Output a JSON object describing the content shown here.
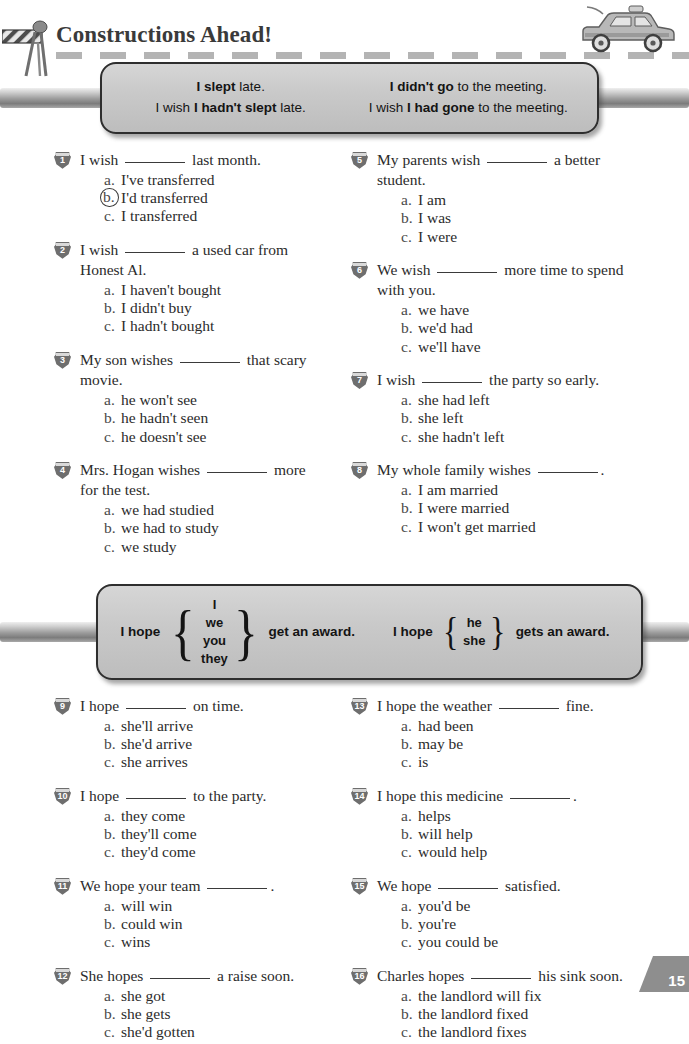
{
  "header": {
    "title": "Constructions Ahead!",
    "barricade_icon": "road-barricade-icon",
    "car_icon": "car-icon",
    "road_line": "dashed-road-marking"
  },
  "page_number": "15",
  "banner_wish": {
    "left": {
      "line1_pre": "",
      "line1_bold": "I slept",
      "line1_post": " late.",
      "line2_pre": "I wish ",
      "line2_bold": "I hadn't slept",
      "line2_post": " late."
    },
    "right": {
      "line1_pre": "",
      "line1_bold": "I didn't go",
      "line1_post": " to the meeting.",
      "line2_pre": "I wish ",
      "line2_bold": "I had gone",
      "line2_post": " to the meeting."
    }
  },
  "banner_hope": {
    "left": {
      "lead": "I hope",
      "subjects": [
        "I",
        "we",
        "you",
        "they"
      ],
      "tail": "get an award."
    },
    "right": {
      "lead": "I hope",
      "subjects": [
        "he",
        "she"
      ],
      "tail": "gets an award."
    }
  },
  "exercises_top": {
    "left": [
      {
        "num": "1",
        "stem_pre": "I wish",
        "stem_post": "last month.",
        "stem_line2": "",
        "choices": [
          {
            "letter": "a.",
            "text": "I've transferred",
            "circled": false
          },
          {
            "letter": "b.",
            "text": "I'd transferred",
            "circled": true
          },
          {
            "letter": "c.",
            "text": "I transferred",
            "circled": false
          }
        ]
      },
      {
        "num": "2",
        "stem_pre": "I wish",
        "stem_post": "a used car from",
        "stem_line2": "Honest Al.",
        "choices": [
          {
            "letter": "a.",
            "text": "I haven't bought",
            "circled": false
          },
          {
            "letter": "b.",
            "text": "I didn't buy",
            "circled": false
          },
          {
            "letter": "c.",
            "text": "I hadn't bought",
            "circled": false
          }
        ]
      },
      {
        "num": "3",
        "stem_pre": "My son wishes",
        "stem_post": "that scary",
        "stem_line2": "movie.",
        "choices": [
          {
            "letter": "a.",
            "text": "he won't see",
            "circled": false
          },
          {
            "letter": "b.",
            "text": "he hadn't seen",
            "circled": false
          },
          {
            "letter": "c.",
            "text": "he doesn't see",
            "circled": false
          }
        ]
      },
      {
        "num": "4",
        "stem_pre": "Mrs. Hogan wishes",
        "stem_post": "more",
        "stem_line2": "for the test.",
        "choices": [
          {
            "letter": "a.",
            "text": "we had studied",
            "circled": false
          },
          {
            "letter": "b.",
            "text": "we had to study",
            "circled": false
          },
          {
            "letter": "c.",
            "text": "we study",
            "circled": false
          }
        ]
      }
    ],
    "right": [
      {
        "num": "5",
        "stem_pre": "My parents wish",
        "stem_post": "a better",
        "stem_line2": "student.",
        "choices": [
          {
            "letter": "a.",
            "text": "I am",
            "circled": false
          },
          {
            "letter": "b.",
            "text": "I was",
            "circled": false
          },
          {
            "letter": "c.",
            "text": "I were",
            "circled": false
          }
        ]
      },
      {
        "num": "6",
        "stem_pre": "We wish",
        "stem_post": "more time to spend",
        "stem_line2": "with you.",
        "choices": [
          {
            "letter": "a.",
            "text": "we have",
            "circled": false
          },
          {
            "letter": "b.",
            "text": "we'd had",
            "circled": false
          },
          {
            "letter": "c.",
            "text": "we'll have",
            "circled": false
          }
        ]
      },
      {
        "num": "7",
        "stem_pre": "I wish",
        "stem_post": "the party so early.",
        "stem_line2": "",
        "choices": [
          {
            "letter": "a.",
            "text": "she had left",
            "circled": false
          },
          {
            "letter": "b.",
            "text": "she left",
            "circled": false
          },
          {
            "letter": "c.",
            "text": "she hadn't left",
            "circled": false
          }
        ]
      },
      {
        "num": "8",
        "stem_pre": "My whole family wishes",
        "stem_post": ".",
        "stem_line2": "",
        "choices": [
          {
            "letter": "a.",
            "text": "I am married",
            "circled": false
          },
          {
            "letter": "b.",
            "text": "I were married",
            "circled": false
          },
          {
            "letter": "c.",
            "text": "I won't get married",
            "circled": false
          }
        ]
      }
    ]
  },
  "exercises_bottom": {
    "left": [
      {
        "num": "9",
        "stem_pre": "I hope",
        "stem_post": "on time.",
        "stem_line2": "",
        "choices": [
          {
            "letter": "a.",
            "text": "she'll arrive",
            "circled": false
          },
          {
            "letter": "b.",
            "text": "she'd arrive",
            "circled": false
          },
          {
            "letter": "c.",
            "text": "she arrives",
            "circled": false
          }
        ]
      },
      {
        "num": "10",
        "stem_pre": "I hope",
        "stem_post": "to the party.",
        "stem_line2": "",
        "choices": [
          {
            "letter": "a.",
            "text": "they come",
            "circled": false
          },
          {
            "letter": "b.",
            "text": "they'll come",
            "circled": false
          },
          {
            "letter": "c.",
            "text": "they'd come",
            "circled": false
          }
        ]
      },
      {
        "num": "11",
        "stem_pre": "We hope your team",
        "stem_post": ".",
        "stem_line2": "",
        "choices": [
          {
            "letter": "a.",
            "text": "will win",
            "circled": false
          },
          {
            "letter": "b.",
            "text": "could win",
            "circled": false
          },
          {
            "letter": "c.",
            "text": "wins",
            "circled": false
          }
        ]
      },
      {
        "num": "12",
        "stem_pre": "She hopes",
        "stem_post": "a raise soon.",
        "stem_line2": "",
        "choices": [
          {
            "letter": "a.",
            "text": "she got",
            "circled": false
          },
          {
            "letter": "b.",
            "text": "she gets",
            "circled": false
          },
          {
            "letter": "c.",
            "text": "she'd gotten",
            "circled": false
          }
        ]
      }
    ],
    "right": [
      {
        "num": "13",
        "stem_pre": "I hope the weather",
        "stem_post": "fine.",
        "stem_line2": "",
        "choices": [
          {
            "letter": "a.",
            "text": "had been",
            "circled": false
          },
          {
            "letter": "b.",
            "text": "may be",
            "circled": false
          },
          {
            "letter": "c.",
            "text": "is",
            "circled": false
          }
        ]
      },
      {
        "num": "14",
        "stem_pre": "I hope this medicine",
        "stem_post": ".",
        "stem_line2": "",
        "choices": [
          {
            "letter": "a.",
            "text": "helps",
            "circled": false
          },
          {
            "letter": "b.",
            "text": "will help",
            "circled": false
          },
          {
            "letter": "c.",
            "text": "would help",
            "circled": false
          }
        ]
      },
      {
        "num": "15",
        "stem_pre": "We hope",
        "stem_post": "satisfied.",
        "stem_line2": "",
        "choices": [
          {
            "letter": "a.",
            "text": "you'd be",
            "circled": false
          },
          {
            "letter": "b.",
            "text": "you're",
            "circled": false
          },
          {
            "letter": "c.",
            "text": "you could be",
            "circled": false
          }
        ]
      },
      {
        "num": "16",
        "stem_pre": "Charles hopes",
        "stem_post": "his sink soon.",
        "stem_line2": "",
        "choices": [
          {
            "letter": "a.",
            "text": "the landlord will fix",
            "circled": false
          },
          {
            "letter": "b.",
            "text": "the landlord fixed",
            "circled": false
          },
          {
            "letter": "c.",
            "text": "the landlord fixes",
            "circled": false
          }
        ]
      }
    ]
  }
}
